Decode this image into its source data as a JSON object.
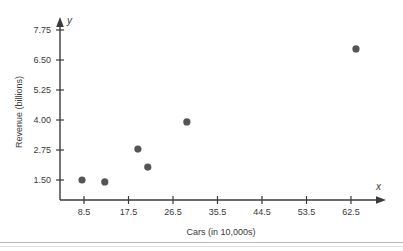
{
  "chart_data": {
    "type": "scatter",
    "title": "",
    "xlabel": "Cars (in 10,000s)",
    "ylabel": "Revenue (billions)",
    "x_axis_variable": "x",
    "y_axis_variable": "y",
    "xticks": [
      8.5,
      17.5,
      26.5,
      35.5,
      44.5,
      53.5,
      62.5
    ],
    "xtick_labels": [
      "8.5",
      "17.5",
      "26.5",
      "35.5",
      "44.5",
      "53.5",
      "62.5"
    ],
    "yticks": [
      1.5,
      2.75,
      4.0,
      5.25,
      6.5,
      7.75
    ],
    "ytick_labels": [
      "1.50",
      "2.75",
      "4.00",
      "5.25",
      "6.50",
      "7.75"
    ],
    "xlim": [
      0,
      69
    ],
    "ylim": [
      0,
      8.4
    ],
    "grid": false,
    "legend": false,
    "marker_color": "#555555",
    "axis_color": "#3a3a3a",
    "background": "#ffffff",
    "points": [
      {
        "x": 8.1,
        "y": 1.5
      },
      {
        "x": 12.7,
        "y": 1.42
      },
      {
        "x": 19.4,
        "y": 2.79
      },
      {
        "x": 21.4,
        "y": 2.04
      },
      {
        "x": 29.3,
        "y": 3.92
      },
      {
        "x": 63.5,
        "y": 6.96
      }
    ]
  }
}
